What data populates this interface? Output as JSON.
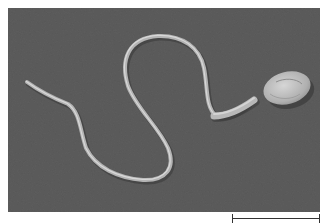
{
  "figure": {
    "background_color": "#5c5c5c",
    "specimen_color": "#b8b8b8",
    "scale_bar": {
      "label": "",
      "color": "#333333"
    }
  }
}
